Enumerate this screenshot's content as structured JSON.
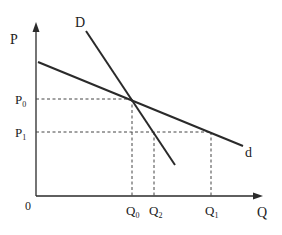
{
  "diagram": {
    "type": "kinked-demand-curves",
    "axes": {
      "y_label": "P",
      "x_label": "Q",
      "origin_label": "0"
    },
    "curves": [
      {
        "name": "D",
        "label": "D",
        "description": "steeper demand curve"
      },
      {
        "name": "d",
        "label": "d",
        "description": "flatter demand curve"
      }
    ],
    "price_levels": [
      {
        "label": "P",
        "sub": "0"
      },
      {
        "label": "P",
        "sub": "1"
      }
    ],
    "quantity_levels": [
      {
        "label": "Q",
        "sub": "0"
      },
      {
        "label": "Q",
        "sub": "2"
      },
      {
        "label": "Q",
        "sub": "1"
      }
    ]
  },
  "colors": {
    "line": "#2a2a2a",
    "text": "#222222",
    "background": "#ffffff"
  }
}
